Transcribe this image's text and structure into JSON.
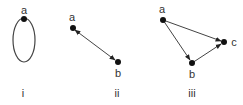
{
  "graphs": [
    {
      "caption": "i",
      "nodes": [
        {
          "id": "a",
          "label": "a"
        }
      ],
      "edges": [
        {
          "from": "a",
          "to": "a",
          "type": "loop",
          "directed": false
        }
      ]
    },
    {
      "caption": "ii",
      "nodes": [
        {
          "id": "a",
          "label": "a"
        },
        {
          "id": "b",
          "label": "b"
        }
      ],
      "edges": [
        {
          "from": "a",
          "to": "b",
          "type": "bidirectional",
          "directed": true
        }
      ]
    },
    {
      "caption": "iii",
      "nodes": [
        {
          "id": "a",
          "label": "a"
        },
        {
          "id": "b",
          "label": "b"
        },
        {
          "id": "c",
          "label": "c"
        }
      ],
      "edges": [
        {
          "from": "a",
          "to": "b",
          "directed": true
        },
        {
          "from": "a",
          "to": "c",
          "directed": true
        },
        {
          "from": "b",
          "to": "c",
          "directed": true
        }
      ]
    }
  ],
  "colors": {
    "edge": "#444444",
    "node": "#111111",
    "text": "#333333"
  }
}
